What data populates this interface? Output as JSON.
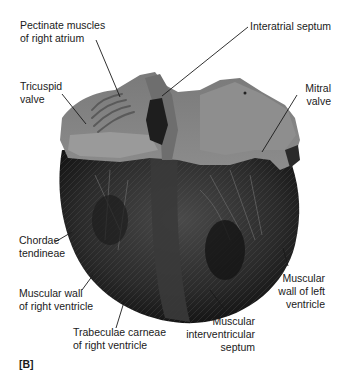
{
  "figure": {
    "panel_label": "[B]",
    "labels": [
      {
        "id": "pectinate",
        "line1": "Pectinate muscles",
        "line2": "of right atrium",
        "line3": ""
      },
      {
        "id": "interatrial",
        "line1": "Interatrial septum",
        "line2": "",
        "line3": ""
      },
      {
        "id": "tricuspid",
        "line1": "Tricuspid",
        "line2": "valve",
        "line3": ""
      },
      {
        "id": "mitral",
        "line1": "Mitral",
        "line2": "valve",
        "line3": ""
      },
      {
        "id": "chordae",
        "line1": "Chordae",
        "line2": "tendineae",
        "line3": ""
      },
      {
        "id": "rv_wall",
        "line1": "Muscular wall",
        "line2": "of right ventricle",
        "line3": ""
      },
      {
        "id": "lv_wall",
        "line1": "Muscular",
        "line2": "wall of left",
        "line3": "ventricle"
      },
      {
        "id": "trabeculae",
        "line1": "Trabeculae carneae",
        "line2": "of right ventricle",
        "line3": ""
      },
      {
        "id": "ivs",
        "line1": "Muscular",
        "line2": "interventricular",
        "line3": "septum"
      }
    ]
  }
}
